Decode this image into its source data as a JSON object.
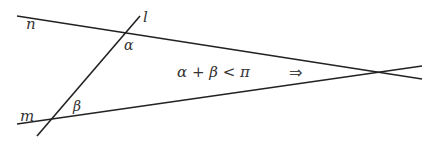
{
  "diagram": {
    "labels": {
      "line_n": "n",
      "line_l": "l",
      "line_m": "m",
      "angle_alpha": "α",
      "angle_beta": "β",
      "condition": "α + β < π",
      "implies": "⇒"
    },
    "colors": {
      "line": "#222222",
      "text": "#333333",
      "background": "#ffffff"
    }
  }
}
